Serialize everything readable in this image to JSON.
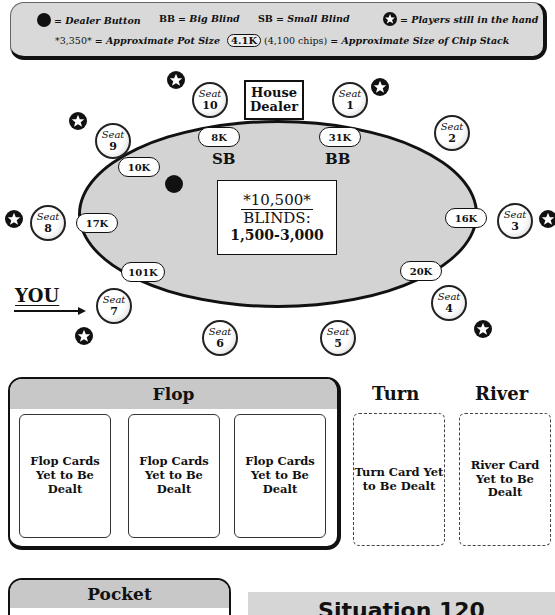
{
  "legend": {
    "dealer_button": "= Dealer Button",
    "bb_abbr": "BB",
    "bb_desc": "= Big Blind",
    "sb_abbr": "SB",
    "sb_desc": "= Small Blind",
    "players_in_hand": "= Players still in the hand",
    "pot_example": "*3,350*",
    "pot_desc": "= Approximate Pot Size",
    "chip_example": "4.1K",
    "chip_example_detail": "(4,100 chips)",
    "chip_desc": "= Approximate Size of Chip Stack"
  },
  "table": {
    "house_dealer_line1": "House",
    "house_dealer_line2": "Dealer",
    "pot": "*10,500*",
    "blinds_label": "BLINDS:",
    "blinds_value": "1,500-3,000",
    "sb_label": "SB",
    "bb_label": "BB",
    "you_label": "YOU",
    "dealer_button_seat": 9,
    "seats": [
      {
        "label": "Seat",
        "number": "1",
        "stack": "31K",
        "in_hand": true
      },
      {
        "label": "Seat",
        "number": "2",
        "stack": "",
        "in_hand": false
      },
      {
        "label": "Seat",
        "number": "3",
        "stack": "16K",
        "in_hand": true
      },
      {
        "label": "Seat",
        "number": "4",
        "stack": "20K",
        "in_hand": true
      },
      {
        "label": "Seat",
        "number": "5",
        "stack": "",
        "in_hand": false
      },
      {
        "label": "Seat",
        "number": "6",
        "stack": "",
        "in_hand": false
      },
      {
        "label": "Seat",
        "number": "7",
        "stack": "101K",
        "in_hand": true
      },
      {
        "label": "Seat",
        "number": "8",
        "stack": "17K",
        "in_hand": true
      },
      {
        "label": "Seat",
        "number": "9",
        "stack": "10K",
        "in_hand": true
      },
      {
        "label": "Seat",
        "number": "10",
        "stack": "8K",
        "in_hand": true
      }
    ]
  },
  "board": {
    "flop_title": "Flop",
    "turn_title": "Turn",
    "river_title": "River",
    "flop_cards": [
      "Flop Cards Yet to Be Dealt",
      "Flop Cards Yet to Be Dealt",
      "Flop Cards Yet to Be Dealt"
    ],
    "turn_card": "Turn Card Yet to Be Dealt",
    "river_card": "River Card Yet to Be Dealt"
  },
  "pocket": {
    "title": "Pocket"
  },
  "situation": {
    "title": "Situation 120"
  }
}
